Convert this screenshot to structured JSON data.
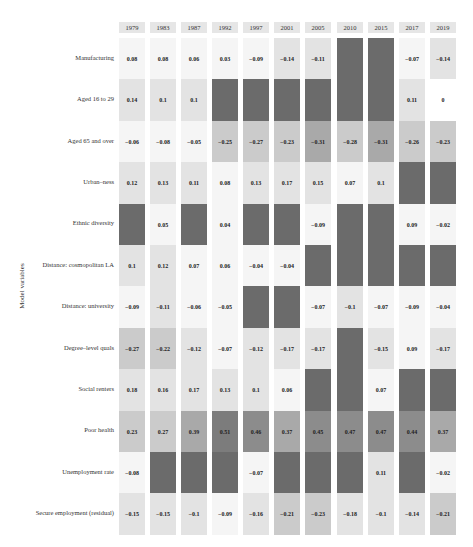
{
  "page_header": "",
  "chart_data": {
    "type": "heatmap",
    "title": "",
    "xlabel": "",
    "ylabel": "Model variables",
    "columns": [
      "1979",
      "1983",
      "1987",
      "1992",
      "1997",
      "2001",
      "2005",
      "2010",
      "2015",
      "2017",
      "2019"
    ],
    "rows": [
      "Manufacturing",
      "Aged 16 to 29",
      "Aged 65 and over",
      "Urban–ness",
      "Ethnic diversity",
      "Distance: cosmopolitan LA",
      "Distance: university",
      "Degree–level quals",
      "Social renters",
      "Poor health",
      "Unemployment rate",
      "Secure employment (residual)"
    ],
    "values": [
      [
        0.08,
        0.08,
        0.06,
        0.03,
        -0.09,
        -0.14,
        -0.11,
        null,
        null,
        -0.07,
        -0.14
      ],
      [
        0.14,
        0.1,
        0.1,
        null,
        null,
        null,
        null,
        null,
        null,
        0.11,
        0
      ],
      [
        -0.06,
        -0.08,
        -0.05,
        -0.25,
        -0.27,
        -0.23,
        -0.31,
        -0.28,
        -0.31,
        -0.26,
        -0.23
      ],
      [
        0.12,
        0.13,
        0.11,
        0.08,
        0.13,
        0.17,
        0.15,
        0.07,
        0.1,
        null,
        null
      ],
      [
        null,
        0.05,
        null,
        0.04,
        null,
        null,
        -0.09,
        null,
        null,
        0.09,
        -0.02
      ],
      [
        0.1,
        0.12,
        0.07,
        0.06,
        -0.04,
        -0.04,
        null,
        null,
        null,
        null,
        null
      ],
      [
        -0.09,
        -0.11,
        -0.06,
        -0.05,
        null,
        null,
        -0.07,
        -0.1,
        -0.07,
        -0.09,
        -0.04
      ],
      [
        -0.27,
        -0.22,
        -0.12,
        -0.07,
        -0.12,
        -0.17,
        -0.17,
        null,
        -0.15,
        0.09,
        -0.17
      ],
      [
        0.18,
        0.16,
        0.17,
        0.13,
        0.1,
        0.06,
        null,
        null,
        0.07,
        null,
        null
      ],
      [
        0.23,
        0.27,
        0.39,
        0.51,
        0.46,
        0.37,
        0.45,
        0.47,
        0.47,
        0.44,
        0.37
      ],
      [
        -0.08,
        null,
        null,
        null,
        -0.07,
        null,
        null,
        null,
        0.11,
        null,
        -0.02
      ],
      [
        -0.15,
        -0.15,
        -0.1,
        -0.09,
        -0.16,
        -0.21,
        -0.23,
        -0.18,
        -0.1,
        -0.14,
        -0.21
      ]
    ],
    "null_meaning": "variable not included (dark grey cell)",
    "colors": {
      "excluded": "#6b6b6b",
      "header_bg": "#e6e6e6",
      "zero": "#ffffff",
      "scale": [
        "#f5f5f5",
        "#e3e3e3",
        "#cbcbcb",
        "#a9a9a9",
        "#8c8c8c",
        "#7c7c7c"
      ]
    },
    "legend": "none",
    "grid": false
  }
}
